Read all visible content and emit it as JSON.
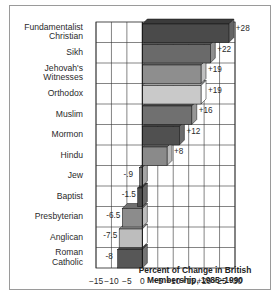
{
  "chart_data": {
    "type": "bar",
    "orientation": "horizontal",
    "style": "3d",
    "title": "",
    "xlabel": "Percent of Change in British\nMembership, 1985–1990",
    "ylabel": "",
    "categories": [
      "Fundamentalist\nChristian",
      "Sikh",
      "Jehovah's\nWitnesses",
      "Orthodox",
      "Muslim",
      "Mormon",
      "Hindu",
      "Jew",
      "Baptist",
      "Presbyterian",
      "Anglican",
      "Roman\nCatholic"
    ],
    "values": [
      28,
      22,
      19,
      19,
      16,
      12,
      8,
      -0.9,
      -1.5,
      -6.5,
      -7.5,
      -8
    ],
    "value_labels": [
      "+28",
      "+22",
      "+19",
      "+19",
      "+16",
      "+12",
      "+8",
      "-.9",
      "-1.5",
      "-6.5",
      "-7.5",
      "-8"
    ],
    "bar_colors": [
      "#4a4a4a",
      "#6a6a6a",
      "#8e8e8e",
      "#c9c9c9",
      "#707070",
      "#505050",
      "#8a8a8a",
      "#7a7a7a",
      "#4e4e4e",
      "#8c8c8c",
      "#bdbdbd",
      "#575757"
    ],
    "xticks": [
      -15,
      -10,
      -5,
      0,
      5,
      10,
      15,
      20,
      25,
      30
    ],
    "xtick_labels": [
      "−15",
      "−10",
      "−5",
      "0",
      "+5",
      "+10",
      "+15",
      "+20",
      "+25",
      "+30"
    ],
    "xlim": [
      -15,
      30
    ],
    "grid": true,
    "legend": null
  }
}
